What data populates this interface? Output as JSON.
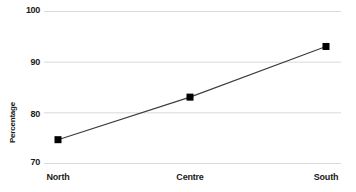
{
  "chart_data": {
    "type": "line",
    "title": "",
    "subtitle": "",
    "xlabel": "",
    "ylabel": "Percentage",
    "categories": [
      "North",
      "Centre",
      "South"
    ],
    "values": [
      74.6,
      83.0,
      93.0
    ],
    "series": [
      {
        "name": "Percentage",
        "values": [
          74.6,
          83.0,
          93.0
        ]
      }
    ],
    "ylim": [
      70,
      100
    ],
    "yticks": [
      70,
      80,
      90,
      100
    ],
    "ytick_labels": [
      "70",
      "80",
      "90",
      "100"
    ],
    "grid": "horizontal",
    "legend": "none",
    "marker": "square",
    "colors": {
      "line": "#3c3c3c",
      "marker": "#000000",
      "grid": "#d9d9d9",
      "text": "#1a1a1a",
      "background": "#ffffff"
    }
  }
}
